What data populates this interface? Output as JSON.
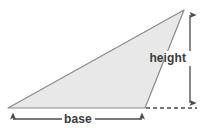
{
  "diagram": {
    "type": "geometry-figure",
    "background_color": "#ffffff",
    "shape": {
      "name": "triangle",
      "fill_color": "#e8e8e8",
      "stroke_color": "#8a8a8a",
      "stroke_width": 1.2,
      "vertices": [
        {
          "label": "left-vertex",
          "x": 8,
          "y": 108
        },
        {
          "label": "apex-vertex",
          "x": 184,
          "y": 10
        },
        {
          "label": "foot-vertex",
          "x": 145,
          "y": 108
        }
      ]
    },
    "annotations": {
      "height": {
        "label": "height",
        "label_x": 187,
        "label_y": 62,
        "line_color": "#4a4a4a",
        "arrow_x": 190,
        "arrow_top_y": 10,
        "arrow_bottom_y": 108,
        "orientation": "vertical",
        "arrowheads": "both"
      },
      "base": {
        "label": "base",
        "label_x": 77,
        "label_y": 123,
        "line_color": "#4a4a4a",
        "arrow_y": 119,
        "arrow_left_x": 8,
        "arrow_right_x": 147,
        "orientation": "horizontal",
        "arrowheads": "both"
      },
      "baseline_extension": {
        "label": "dashed-baseline-extension",
        "stroke_color": "#4a4a4a",
        "dash_pattern": "4 3",
        "y": 108,
        "x_start": 146,
        "x_end": 197
      }
    }
  }
}
